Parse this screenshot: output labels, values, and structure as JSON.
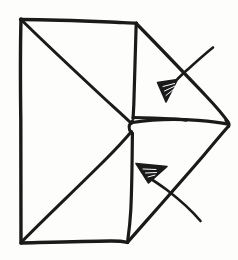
{
  "figure": {
    "title": "Hand-drawn envelope fold diagram",
    "style": "hand-drawn ink sketch",
    "caption": "",
    "canvas": {
      "width": 238,
      "height": 260
    },
    "colors": {
      "ink": "#1a1a1a",
      "paper": "#fdfdfc",
      "hatch_highlight": "#fdfdfc"
    },
    "annotations": [
      {
        "id": "upper-arrow",
        "label": "",
        "shape": "solid-triangle-arrowhead",
        "direction": "points-right-down",
        "target": "upper fold crease",
        "tip_x": 178,
        "tip_y": 82,
        "leader_from_x": 212,
        "leader_from_y": 48
      },
      {
        "id": "lower-arrow",
        "label": "",
        "shape": "solid-triangle-arrowhead",
        "direction": "points-left-down",
        "target": "lower fold crease",
        "tip_x": 146,
        "tip_y": 182,
        "leader_from_x": 200,
        "leader_from_y": 221
      }
    ],
    "geometry": {
      "outline_label": "envelope outer boundary",
      "left_edge": "vertical left side of the envelope body",
      "top_edge": "top edge of the envelope body",
      "bottom_edge": "bottom edge of the envelope body",
      "right_vertical": "right edge of the envelope body",
      "center_vertex": "central convergence point of the folded flaps",
      "right_point": "far right tip of the outer flap",
      "strokes": [
        {
          "name": "left-vertical-edge",
          "d": "M21,19 L20.5,70 L21,120 L20.5,180 L21,243"
        },
        {
          "name": "top-edge",
          "d": "M21,19 L50,20 L85,21 L112,22 L136,23"
        },
        {
          "name": "bottom-edge",
          "d": "M21,243 L55,242 L90,241 L112,241 L127,242"
        },
        {
          "name": "right-vertical-edge",
          "d": "M136,23 L135,50 L134,85 L133,112 L133,120"
        },
        {
          "name": "right-vertical-edge-lower",
          "d": "M132,134 L132,165 L131,200 L128,228 L127,242"
        },
        {
          "name": "top-left-diagonal-to-center",
          "d": "M21,19 L55,51 L92,88 L120,113 L131,124"
        },
        {
          "name": "bottom-left-diagonal-to-center",
          "d": "M21,243 L55,209 L92,172 L120,143 L131,131"
        },
        {
          "name": "upper-flap-diagonal",
          "d": "M136,23 L165,52 L196,85 L216,106 L228,122"
        },
        {
          "name": "lower-flap-diagonal",
          "d": "M127,242 L152,214 L185,178 L212,146 L228,128"
        },
        {
          "name": "center-horizontal-crease",
          "d": "M133,122 L160,119 L190,120 L212,122 L228,124"
        },
        {
          "name": "center-crease-left-hook",
          "d": "M133,122 L129,125 L130,130 L133,133"
        },
        {
          "name": "upper-flap-base-crease",
          "d": "M133,117 L150,118 L170,119 L186,120"
        },
        {
          "name": "upper-leader-line",
          "d": "M212,48 L203,56 L188,68 L178,78"
        },
        {
          "name": "lower-leader-line",
          "d": "M200,221 L190,210 L170,194 L152,182"
        }
      ]
    }
  }
}
